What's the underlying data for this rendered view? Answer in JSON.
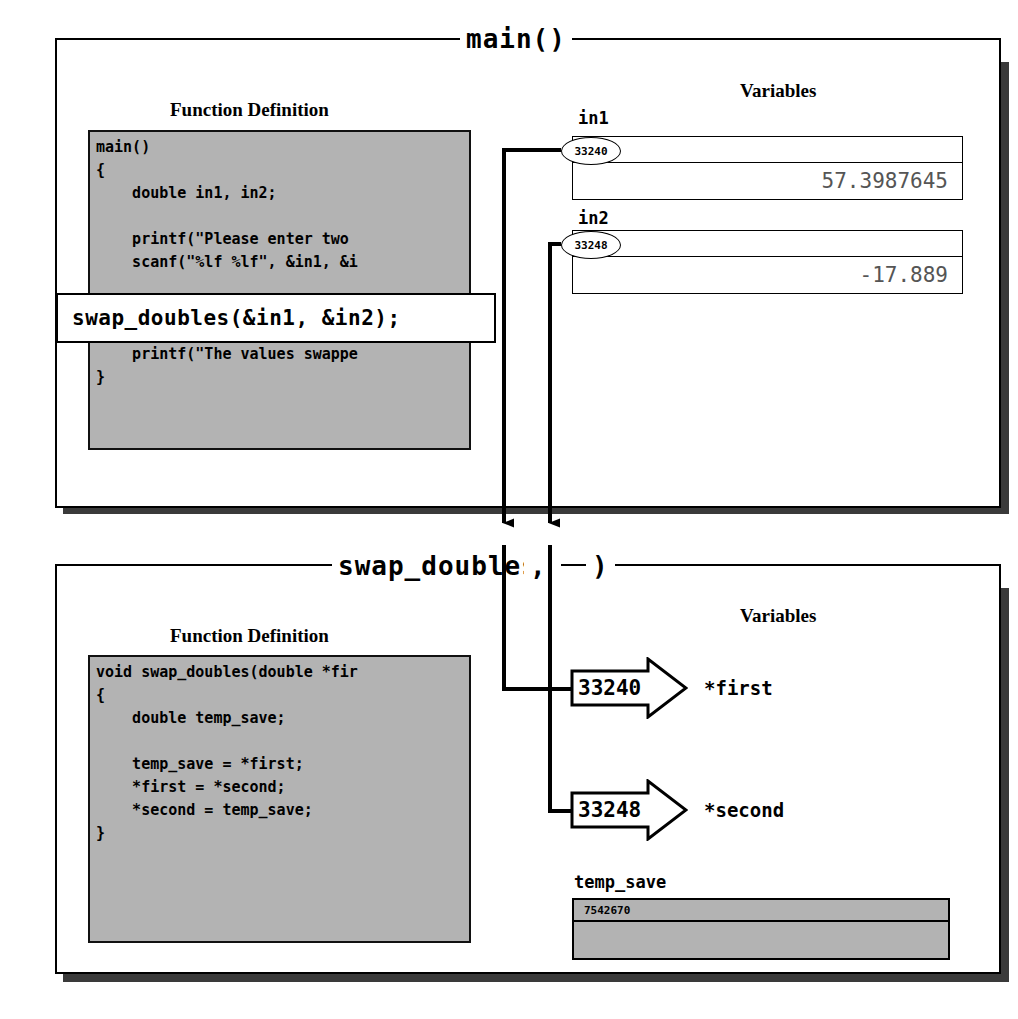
{
  "diagram": {
    "type": "function-call-parameter-passing",
    "frames": [
      {
        "title": "main()",
        "function_definition_caption": "Function Definition",
        "variables_caption": "Variables",
        "code": "main()\n{\n    double in1, in2;\n\n    printf(\"Please enter two\n    scanf(\"%lf %lf\", &in1, &i\n\n\n\n    printf(\"The values swappe\n}",
        "highlighted_call": "swap_doubles(&in1, &in2);",
        "variables": [
          {
            "name": "in1",
            "address": "33240",
            "value": "57.3987645"
          },
          {
            "name": "in2",
            "address": "33248",
            "value": "-17.889"
          }
        ]
      },
      {
        "title_prefix": "swap_doubles(",
        "title_separator": ",",
        "title_suffix": ")",
        "function_definition_caption": "Function Definition",
        "variables_caption": "Variables",
        "code": "void swap_doubles(double *fir\n{\n    double temp_save;\n\n    temp_save = *first;\n    *first = *second;\n    *second = temp_save;\n}",
        "parameters": [
          {
            "address": "33240",
            "name": "*first"
          },
          {
            "address": "33248",
            "name": "*second"
          }
        ],
        "locals": [
          {
            "name": "temp_save",
            "address": "7542670",
            "value": ""
          }
        ]
      }
    ],
    "colors": {
      "code_background": "#b3b3b3",
      "panel_background": "#ffffff",
      "line": "#000000",
      "shadow": "#3a3a3a",
      "value_text": "#555555"
    }
  }
}
